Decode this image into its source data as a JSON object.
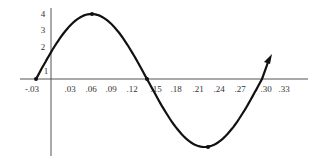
{
  "chart_data": {
    "type": "line",
    "title": "",
    "xlabel": "",
    "ylabel": "",
    "function": "y = 4 sin(2π(x + 0.03)/0.36)",
    "x_ticks": [
      "-.03",
      ".03",
      ".06",
      ".09",
      ".12",
      ".15",
      ".18",
      ".21",
      ".24",
      ".27",
      ".30",
      ".33"
    ],
    "y_ticks": [
      "1",
      "2",
      "3",
      "4"
    ],
    "key_points": [
      {
        "x": -0.03,
        "y": 0
      },
      {
        "x": 0.06,
        "y": 4
      },
      {
        "x": 0.15,
        "y": 0
      },
      {
        "x": 0.24,
        "y": -4
      },
      {
        "x": 0.33,
        "y": 0
      }
    ],
    "xlim": [
      -0.03,
      0.33
    ],
    "ylim": [
      -4,
      4
    ],
    "grid": false,
    "legend": null,
    "arrow_at_end": true,
    "line_color": "#111111"
  }
}
